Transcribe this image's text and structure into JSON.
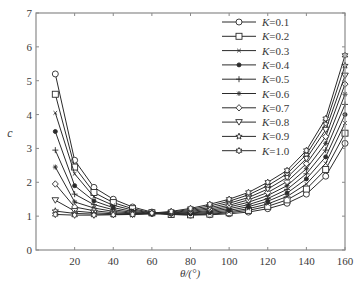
{
  "chart_data": {
    "type": "line",
    "title": "",
    "xlabel": "θ/(°)",
    "ylabel": "c",
    "xlim": [
      0,
      160
    ],
    "ylim": [
      0,
      7
    ],
    "xticks": [
      20,
      40,
      60,
      80,
      100,
      120,
      140,
      160
    ],
    "yticks": [
      0,
      1,
      2,
      3,
      4,
      5,
      6,
      7
    ],
    "grid": false,
    "legend_position": "upper right",
    "x": [
      10,
      20,
      30,
      40,
      50,
      60,
      70,
      80,
      90,
      100,
      110,
      120,
      130,
      140,
      150,
      160
    ],
    "series": [
      {
        "name": "K=0.1",
        "marker": "circle",
        "values": [
          5.2,
          2.65,
          1.85,
          1.5,
          1.27,
          1.12,
          1.05,
          1.03,
          1.04,
          1.07,
          1.12,
          1.22,
          1.38,
          1.65,
          2.18,
          3.15
        ]
      },
      {
        "name": "K=0.2",
        "marker": "square",
        "values": [
          4.6,
          2.45,
          1.7,
          1.4,
          1.22,
          1.1,
          1.05,
          1.04,
          1.06,
          1.1,
          1.17,
          1.29,
          1.48,
          1.8,
          2.38,
          3.45
        ]
      },
      {
        "name": "K=0.3",
        "marker": "x",
        "values": [
          4.05,
          2.25,
          1.57,
          1.32,
          1.18,
          1.09,
          1.05,
          1.05,
          1.08,
          1.13,
          1.22,
          1.36,
          1.58,
          1.95,
          2.56,
          3.75
        ]
      },
      {
        "name": "K=0.4",
        "marker": "dot",
        "values": [
          3.5,
          1.9,
          1.45,
          1.25,
          1.14,
          1.08,
          1.06,
          1.07,
          1.11,
          1.17,
          1.28,
          1.44,
          1.68,
          2.1,
          2.75,
          4.0
        ]
      },
      {
        "name": "K=0.5",
        "marker": "plus",
        "values": [
          2.95,
          1.65,
          1.34,
          1.19,
          1.11,
          1.07,
          1.07,
          1.09,
          1.14,
          1.22,
          1.34,
          1.52,
          1.79,
          2.25,
          2.95,
          4.3
        ]
      },
      {
        "name": "K=0.6",
        "marker": "asterisk",
        "values": [
          2.45,
          1.42,
          1.24,
          1.14,
          1.09,
          1.07,
          1.08,
          1.11,
          1.17,
          1.27,
          1.41,
          1.61,
          1.9,
          2.4,
          3.15,
          4.6
        ]
      },
      {
        "name": "K=0.7",
        "marker": "diamond",
        "values": [
          1.95,
          1.27,
          1.16,
          1.1,
          1.07,
          1.07,
          1.09,
          1.14,
          1.21,
          1.32,
          1.48,
          1.7,
          2.02,
          2.55,
          3.35,
          4.9
        ]
      },
      {
        "name": "K=0.8",
        "marker": "triangle-down",
        "values": [
          1.47,
          1.15,
          1.1,
          1.07,
          1.06,
          1.07,
          1.1,
          1.17,
          1.25,
          1.38,
          1.55,
          1.8,
          2.14,
          2.7,
          3.55,
          5.15
        ]
      },
      {
        "name": "K=0.9",
        "marker": "pentagram",
        "values": [
          1.15,
          1.08,
          1.06,
          1.05,
          1.05,
          1.08,
          1.12,
          1.2,
          1.3,
          1.44,
          1.63,
          1.9,
          2.25,
          2.82,
          3.72,
          5.45
        ]
      },
      {
        "name": "K=1.0",
        "marker": "hexagram",
        "values": [
          1.05,
          1.03,
          1.03,
          1.04,
          1.05,
          1.09,
          1.14,
          1.23,
          1.35,
          1.5,
          1.7,
          2.0,
          2.35,
          2.94,
          3.88,
          5.75
        ]
      }
    ]
  },
  "colors": {
    "axis": "#8a8a8a",
    "line": "#2b2b2b",
    "text": "#3a3a3a",
    "background": "#ffffff"
  }
}
